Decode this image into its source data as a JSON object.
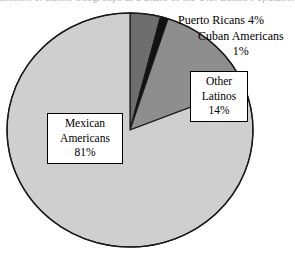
{
  "figure": {
    "title_fragment": "Exhibit 1.  Latino Subgroups as a Share of the U.S. Latino Population",
    "background": "#ffffff"
  },
  "chart_data": {
    "type": "pie",
    "title": "Exhibit 1.  Latino Subgroups as a Share of the U.S. Latino Population",
    "categories": [
      "Mexican Americans",
      "Puerto Ricans",
      "Cuban Americans",
      "Other Latinos"
    ],
    "values": [
      81,
      4,
      1,
      14
    ],
    "value_unit": "%",
    "start_angle_deg": 0,
    "direction": "clockwise",
    "grid": false,
    "legend": "none",
    "labels_inline": true,
    "slices": [
      {
        "name": "Puerto Ricans",
        "value": 4,
        "label": "Puerto Ricans 4%",
        "color": "#6e6e6e",
        "label_style": "plain"
      },
      {
        "name": "Cuban Americans",
        "value": 1,
        "label_line1": "Cuban Americans",
        "label_line2": "1%",
        "color": "#111111",
        "label_style": "plain"
      },
      {
        "name": "Other Latinos",
        "value": 14,
        "label_line1": "Other",
        "label_line2": "Latinos",
        "label_line3": "14%",
        "color": "#8e8e8e",
        "label_style": "boxed"
      },
      {
        "name": "Mexican Americans",
        "value": 81,
        "label_line1": "Mexican",
        "label_line2": "Americans",
        "label_line3": "81%",
        "color": "#cfcfcf",
        "label_style": "boxed"
      }
    ],
    "outline_color": "#1a1a1a",
    "geometry": {
      "center_x": 130,
      "center_y": 130,
      "radius_x": 123,
      "radius_y": 117
    }
  }
}
